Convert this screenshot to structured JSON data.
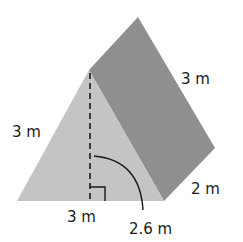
{
  "figure": {
    "type": "triangular-prism",
    "colors": {
      "front_face": "#c4c4c4",
      "side_face": "#8f8f8f",
      "background": "#ffffff",
      "lines": "#1a1a1a"
    },
    "labels": {
      "slant_edge_top": "3 m",
      "left_edge": "3 m",
      "base": "3 m",
      "depth": "2 m",
      "height": "2.6 m"
    }
  }
}
